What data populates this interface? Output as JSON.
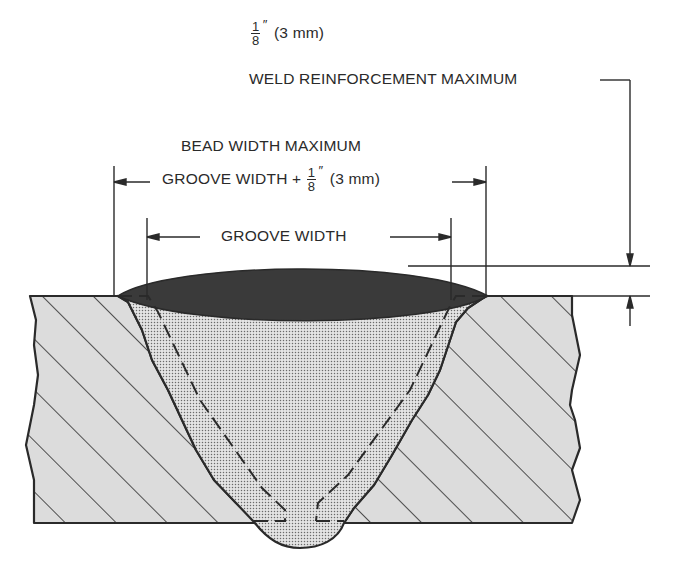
{
  "diagram": {
    "labels": {
      "reinforcement_fraction": {
        "numerator": "1",
        "denominator": "8",
        "unit": "″",
        "metric": "(3 mm)"
      },
      "reinforcement_max": "WELD REINFORCEMENT MAXIMUM",
      "bead_width_max": "BEAD WIDTH MAXIMUM",
      "groove_width_plus_prefix": "GROOVE WIDTH +",
      "groove_width_plus_fraction": {
        "numerator": "1",
        "denominator": "8",
        "unit": "″",
        "metric": "(3 mm)"
      },
      "groove_width": "GROOVE WIDTH"
    },
    "components": [
      "base-metal-left",
      "base-metal-right",
      "weld-metal",
      "weld-reinforcement-crown",
      "groove-outline-dashed"
    ],
    "colors": {
      "ink": "#2a2a2a",
      "base_metal_fill": "#dcdcdc",
      "weld_fill": "#cfcfcf",
      "crown_fill": "#3a3a3a",
      "background": "#ffffff"
    }
  }
}
